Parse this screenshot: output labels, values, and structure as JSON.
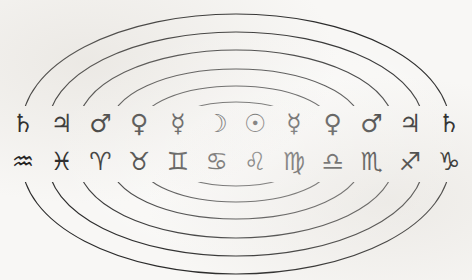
{
  "diagram": {
    "background_color": "#f8f7f5",
    "stroke_color": "#2b2b2b",
    "glyph_color": "#161616",
    "sphere_count": 6,
    "spheres": [
      {
        "name": "sphere-1-moon",
        "label": "Moon sphere"
      },
      {
        "name": "sphere-2-mercury",
        "label": "Mercury sphere"
      },
      {
        "name": "sphere-3-venus",
        "label": "Venus sphere"
      },
      {
        "name": "sphere-4-mars",
        "label": "Mars sphere"
      },
      {
        "name": "sphere-5-jupiter",
        "label": "Jupiter sphere"
      },
      {
        "name": "sphere-6-saturn",
        "label": "Saturn sphere"
      }
    ],
    "planet_row": {
      "label": "Planetary symbols",
      "cells": [
        {
          "glyph": "♄",
          "name": "saturn"
        },
        {
          "glyph": "♃",
          "name": "jupiter"
        },
        {
          "glyph": "♂",
          "name": "mars"
        },
        {
          "glyph": "♀",
          "name": "venus"
        },
        {
          "glyph": "☿",
          "name": "mercury"
        },
        {
          "glyph": "☽",
          "name": "moon"
        },
        {
          "glyph": "☉",
          "name": "sun"
        },
        {
          "glyph": "☿",
          "name": "mercury"
        },
        {
          "glyph": "♀",
          "name": "venus"
        },
        {
          "glyph": "♂",
          "name": "mars"
        },
        {
          "glyph": "♃",
          "name": "jupiter"
        },
        {
          "glyph": "♄",
          "name": "saturn"
        }
      ]
    },
    "zodiac_row": {
      "label": "Zodiac symbols",
      "cells": [
        {
          "glyph": "♒",
          "name": "aquarius"
        },
        {
          "glyph": "♓",
          "name": "pisces"
        },
        {
          "glyph": "♈",
          "name": "aries"
        },
        {
          "glyph": "♉",
          "name": "taurus"
        },
        {
          "glyph": "♊",
          "name": "gemini"
        },
        {
          "glyph": "♋",
          "name": "cancer"
        },
        {
          "glyph": "♌",
          "name": "leo"
        },
        {
          "glyph": "♍",
          "name": "virgo"
        },
        {
          "glyph": "♎",
          "name": "libra"
        },
        {
          "glyph": "♏",
          "name": "scorpio"
        },
        {
          "glyph": "♐",
          "name": "sagittarius"
        },
        {
          "glyph": "♑",
          "name": "capricorn"
        }
      ]
    }
  }
}
